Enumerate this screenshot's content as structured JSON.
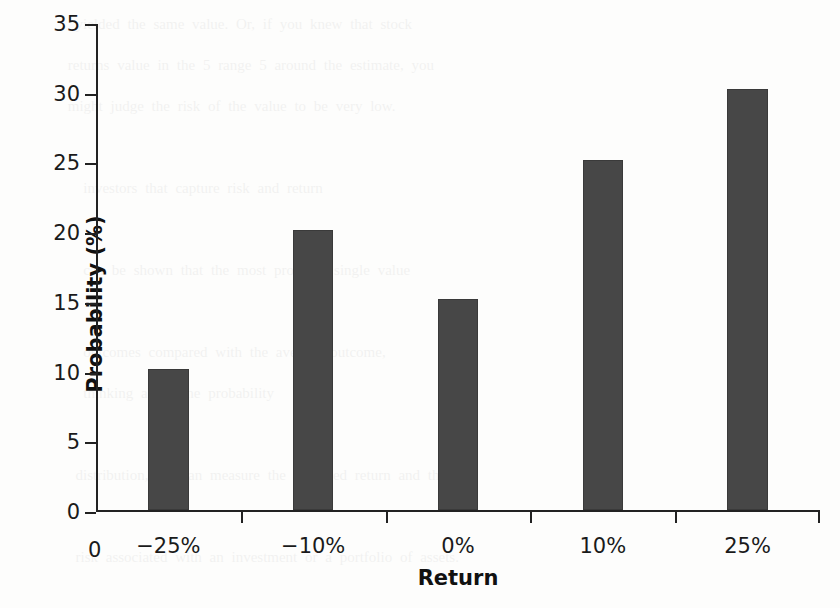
{
  "chart_data": {
    "type": "bar",
    "title": "",
    "xlabel": "Return",
    "ylabel": "Probability (%)",
    "categories": [
      "−25%",
      "−10%",
      "0%",
      "10%",
      "25%"
    ],
    "values": [
      10.1,
      20.1,
      15.1,
      25.1,
      30.2
    ],
    "ylim": [
      0,
      35
    ],
    "y_ticks": [
      0,
      5,
      10,
      15,
      20,
      25,
      30,
      35
    ],
    "y_tick_labels": [
      "0",
      "5",
      "10",
      "15",
      "20",
      "25",
      "30",
      "35"
    ],
    "x_origin_label": "0",
    "grid": false,
    "legend": null,
    "bar_color": "#474747",
    "axis_color": "#222222",
    "background_color": "#fdfdfc"
  },
  "ghost": {
    "lines": "  yielded the same value. Or, if you knew that stock\n returns value in the 5 range 5 around the estimate, you\n might judge the risk of the value to be very low.\n\n   investors that capture risk and return\n\n   can be shown that the most probable single value\n\n   outcomes compared with the average outcome,\n   thinking about the probability\n\n  distribution, we can measure the expected return and the\n\n  risk associated with an investment or a portfolio of assets."
  }
}
